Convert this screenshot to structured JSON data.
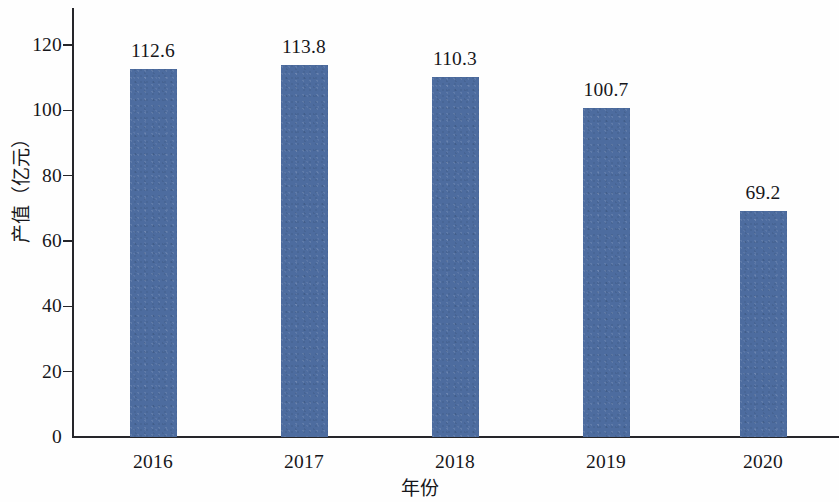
{
  "chart_data": {
    "type": "bar",
    "title": "",
    "subtitle": "",
    "xlabel": "年份",
    "ylabel": "产值（亿元）",
    "categories": [
      "2016",
      "2017",
      "2018",
      "2019",
      "2020"
    ],
    "values": [
      112.6,
      113.8,
      110.3,
      100.7,
      69.2
    ],
    "value_labels": [
      "112.6",
      "113.8",
      "110.3",
      "100.7",
      "69.2"
    ],
    "series": [
      {
        "name": "产值",
        "values": [
          112.6,
          113.8,
          110.3,
          100.7,
          69.2
        ],
        "color": "#4d6c9f"
      }
    ],
    "ylim": [
      0,
      130
    ],
    "yticks": [
      0,
      20,
      40,
      60,
      80,
      100,
      120
    ],
    "ytick_labels": [
      "0",
      "20",
      "40",
      "60",
      "80",
      "100",
      "120"
    ],
    "grid": false,
    "legend": null,
    "legend_position": "none",
    "annotations": [],
    "bar_color": "#4d6c9f",
    "axis_color": "#26262a",
    "background_color": "#ffffff"
  },
  "axes": {
    "y_title": "产值（亿元）",
    "x_title": "年份"
  }
}
